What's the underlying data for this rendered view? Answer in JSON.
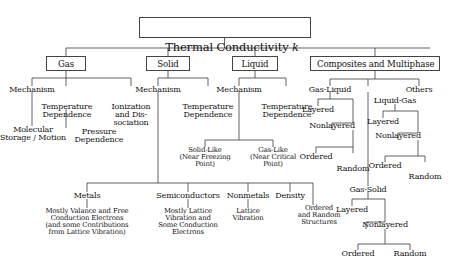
{
  "diagram": {
    "type": "tree",
    "title": "Thermal Conductivity k",
    "root": {
      "label": "Thermal Conductivity k",
      "label_main": "Thermal Conductivity ",
      "label_italic": "k"
    },
    "level1": [
      {
        "label": "Gas"
      },
      {
        "label": "Solid"
      },
      {
        "label": "Liquid"
      },
      {
        "label": "Composites and Multiphase"
      }
    ],
    "gas_branch": {
      "mechanism": "Mechanism",
      "molecular_storage_motion": "Molecular\nStorage / Motion",
      "temperature_dependence": "Temperature\nDependence",
      "pressure_dependence": "Pressure\nDependence",
      "ionization_and_dissociation": "Ionization\nand Dis-\nsociation"
    },
    "solid_branch": {
      "mechanism": "Mechanism",
      "temperature_dependence": "Temperature\nDependence",
      "metals": "Metals",
      "metals_detail": "Mostly Valance and Free\nConduction Electrons\n(and some Contributions\nfrom Lattice Vibration)",
      "semiconductors": "Semiconductors",
      "semiconductors_detail": "Mostly Lattice\nVibration and\nSome Conduction\nElectrons",
      "nonmetals": "Nonmetals",
      "nonmetals_detail": "Lattice\nVibration",
      "density": "Density",
      "ordered_random_structures": "Ordered\nand Random\nStructures"
    },
    "liquid_branch": {
      "mechanism": "Mechanism",
      "temperature_dependence": "Temperature\nDependence",
      "solid_like": "Solid-Like\n(Near Freezing\nPoint)",
      "gas_like": "Gas-Like\n(Near Critical\nPoint)"
    },
    "composites_branch": {
      "gas_liquid": "Gas-Liquid",
      "gas_liquid_layered": "Layered",
      "gas_liquid_nonlayered": "Nonlayered",
      "gas_liquid_ordered": "Ordered",
      "gas_liquid_random": "Random",
      "liquid_gas": "Liquid-Gas",
      "liquid_gas_layered": "Layered",
      "liquid_gas_nonlayered": "Nonlayered",
      "liquid_gas_ordered": "Ordered",
      "liquid_gas_random": "Random",
      "gas_solid": "Gas-Solid",
      "gas_solid_layered": "Layered",
      "gas_solid_nonlayered": "Nonlayered",
      "gas_solid_ordered": "Ordered",
      "gas_solid_random": "Random",
      "others": "Others"
    },
    "colors": {
      "line": "#3a3a3a",
      "text": "#111111",
      "box_border": "#444444",
      "background": "#ffffff"
    }
  }
}
